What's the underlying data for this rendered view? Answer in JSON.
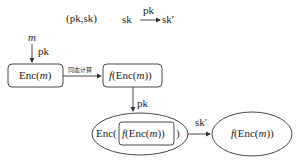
{
  "diagram": {
    "title_keys": "(pk,sk)",
    "key_transform": {
      "from": "sk",
      "label": "pk",
      "to": "sk′"
    },
    "input": {
      "message": "m",
      "key_label": "pk"
    },
    "nodes": {
      "enc_m": {
        "prefix": "Enc(",
        "var": "m",
        "suffix": ")"
      },
      "f_enc_m": {
        "prefix": "f(Enc(",
        "var": "m",
        "suffix": "))"
      },
      "reenc": {
        "outer_prefix": "Enc(",
        "inner_prefix": "f(Enc(",
        "var": "m",
        "inner_suffix": "))",
        "outer_suffix": ")"
      },
      "result": {
        "prefix": "f(Enc(",
        "var": "m",
        "suffix": "))"
      }
    },
    "edges": {
      "homomorphic_label": "同态计算",
      "reencrypt_key": "pk",
      "decrypt_key": "sk′"
    },
    "colors": {
      "stroke": "#333333",
      "background": "#ffffff"
    }
  }
}
